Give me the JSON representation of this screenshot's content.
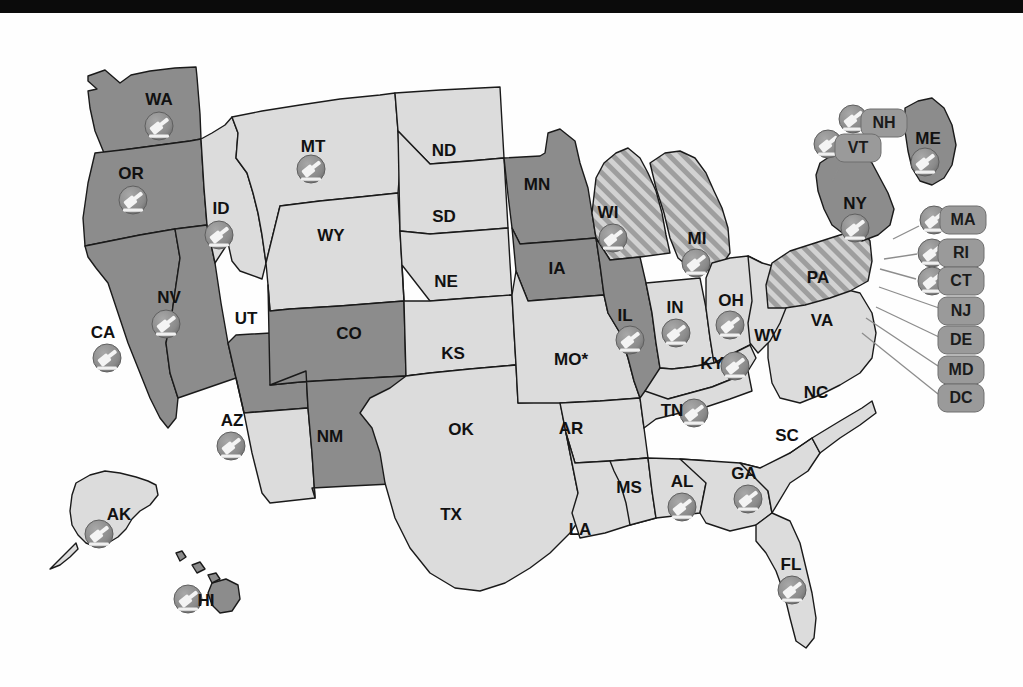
{
  "figure": {
    "kind": "choropleth-map",
    "region": "United States",
    "top_banner_color": "#0b0b0b",
    "background_color": "#ffffff"
  },
  "legend_colors": {
    "dark_gray": "#8c8c8c",
    "light_gray": "#dcdcdc",
    "hatched_base": "#d0d0d0",
    "hatched_stripe": "#9b9b9b",
    "outline": "#1a1a1a",
    "pill_fill": "#9a9a9a",
    "icon_badge": "#8a8a8a",
    "icon_glyph": "#f2f2f2",
    "leader_line": "#8d8d8d"
  },
  "icon": {
    "name": "gavel-icon",
    "description": "white gavel glyph inside a gray circular badge"
  },
  "annotations": {
    "missouri_asterisk": "MO*"
  },
  "states": [
    {
      "code": "WA",
      "label": "WA",
      "fill": "dark",
      "icon": true,
      "lx": 159,
      "ly": 88,
      "ix": 159,
      "iy": 113
    },
    {
      "code": "OR",
      "label": "OR",
      "fill": "dark",
      "icon": true,
      "lx": 131,
      "ly": 162,
      "ix": 133,
      "iy": 187
    },
    {
      "code": "CA",
      "label": "CA",
      "fill": "dark",
      "icon": true,
      "lx": 103,
      "ly": 321,
      "ix": 107,
      "iy": 345
    },
    {
      "code": "NV",
      "label": "NV",
      "fill": "dark",
      "icon": true,
      "lx": 169,
      "ly": 286,
      "ix": 166,
      "iy": 311
    },
    {
      "code": "ID",
      "label": "ID",
      "fill": "light",
      "icon": true,
      "lx": 221,
      "ly": 197,
      "ix": 219,
      "iy": 222
    },
    {
      "code": "MT",
      "label": "MT",
      "fill": "light",
      "icon": true,
      "lx": 313,
      "ly": 135,
      "ix": 311,
      "iy": 156
    },
    {
      "code": "WY",
      "label": "WY",
      "fill": "light",
      "icon": false,
      "lx": 331,
      "ly": 224
    },
    {
      "code": "UT",
      "label": "UT",
      "fill": "dark",
      "icon": false,
      "lx": 246,
      "ly": 307
    },
    {
      "code": "AZ",
      "label": "AZ",
      "fill": "light",
      "icon": true,
      "lx": 232,
      "ly": 409,
      "ix": 231,
      "iy": 433
    },
    {
      "code": "CO",
      "label": "CO",
      "fill": "dark",
      "icon": false,
      "lx": 349,
      "ly": 322
    },
    {
      "code": "NM",
      "label": "NM",
      "fill": "dark",
      "icon": false,
      "lx": 330,
      "ly": 425
    },
    {
      "code": "ND",
      "label": "ND",
      "fill": "light",
      "icon": false,
      "lx": 444,
      "ly": 139
    },
    {
      "code": "SD",
      "label": "SD",
      "fill": "light",
      "icon": false,
      "lx": 444,
      "ly": 205
    },
    {
      "code": "NE",
      "label": "NE",
      "fill": "light",
      "icon": false,
      "lx": 446,
      "ly": 270
    },
    {
      "code": "KS",
      "label": "KS",
      "fill": "light",
      "icon": false,
      "lx": 453,
      "ly": 342
    },
    {
      "code": "OK",
      "label": "OK",
      "fill": "light",
      "icon": false,
      "lx": 461,
      "ly": 418
    },
    {
      "code": "TX",
      "label": "TX",
      "fill": "light",
      "icon": false,
      "lx": 451,
      "ly": 503
    },
    {
      "code": "MN",
      "label": "MN",
      "fill": "dark",
      "icon": false,
      "lx": 537,
      "ly": 173
    },
    {
      "code": "IA",
      "label": "IA",
      "fill": "dark",
      "icon": false,
      "lx": 557,
      "ly": 257
    },
    {
      "code": "MO",
      "label": "MO*",
      "fill": "light",
      "icon": false,
      "lx": 571,
      "ly": 348
    },
    {
      "code": "AR",
      "label": "AR",
      "fill": "light",
      "icon": false,
      "lx": 571,
      "ly": 417
    },
    {
      "code": "LA",
      "label": "LA",
      "fill": "light",
      "icon": false,
      "lx": 580,
      "ly": 518
    },
    {
      "code": "WI",
      "label": "WI",
      "fill": "hatch",
      "icon": true,
      "lx": 608,
      "ly": 201,
      "ix": 613,
      "iy": 225
    },
    {
      "code": "IL",
      "label": "IL",
      "fill": "dark",
      "icon": true,
      "lx": 625,
      "ly": 304,
      "ix": 630,
      "iy": 327
    },
    {
      "code": "MI",
      "label": "MI",
      "fill": "hatch",
      "icon": true,
      "lx": 697,
      "ly": 227,
      "ix": 696,
      "iy": 250
    },
    {
      "code": "IN",
      "label": "IN",
      "fill": "light",
      "icon": true,
      "lx": 675,
      "ly": 296,
      "ix": 676,
      "iy": 320
    },
    {
      "code": "OH",
      "label": "OH",
      "fill": "light",
      "icon": true,
      "lx": 731,
      "ly": 289,
      "ix": 730,
      "iy": 312
    },
    {
      "code": "KY",
      "label": "KY",
      "fill": "light",
      "icon": true,
      "lx": 712,
      "ly": 352,
      "ix": 735,
      "iy": 353
    },
    {
      "code": "TN",
      "label": "TN",
      "fill": "light",
      "icon": true,
      "lx": 672,
      "ly": 399,
      "ix": 694,
      "iy": 400
    },
    {
      "code": "MS",
      "label": "MS",
      "fill": "light",
      "icon": false,
      "lx": 629,
      "ly": 476
    },
    {
      "code": "AL",
      "label": "AL",
      "fill": "light",
      "icon": true,
      "lx": 682,
      "ly": 470,
      "ix": 682,
      "iy": 494
    },
    {
      "code": "GA",
      "label": "GA",
      "fill": "light",
      "icon": true,
      "lx": 744,
      "ly": 462,
      "ix": 748,
      "iy": 486
    },
    {
      "code": "FL",
      "label": "FL",
      "fill": "light",
      "icon": true,
      "lx": 791,
      "ly": 553,
      "ix": 792,
      "iy": 577
    },
    {
      "code": "SC",
      "label": "SC",
      "fill": "light",
      "icon": false,
      "lx": 787,
      "ly": 424
    },
    {
      "code": "NC",
      "label": "NC",
      "fill": "light",
      "icon": false,
      "lx": 816,
      "ly": 381
    },
    {
      "code": "VA",
      "label": "VA",
      "fill": "light",
      "icon": false,
      "lx": 822,
      "ly": 309
    },
    {
      "code": "WV",
      "label": "WV",
      "fill": "light",
      "icon": false,
      "lx": 768,
      "ly": 324
    },
    {
      "code": "PA",
      "label": "PA",
      "fill": "hatch",
      "icon": false,
      "lx": 818,
      "ly": 266
    },
    {
      "code": "NY",
      "label": "NY",
      "fill": "dark",
      "icon": true,
      "lx": 855,
      "ly": 192,
      "ix": 855,
      "iy": 215
    },
    {
      "code": "ME",
      "label": "ME",
      "fill": "dark",
      "icon": true,
      "lx": 928,
      "ly": 127,
      "ix": 925,
      "iy": 149
    },
    {
      "code": "AK",
      "label": "AK",
      "fill": "light",
      "icon": true,
      "lx": 119,
      "ly": 503,
      "ix": 99,
      "iy": 521
    },
    {
      "code": "HI",
      "label": "HI",
      "fill": "dark",
      "icon": true,
      "lx": 206,
      "ly": 589,
      "ix": 188,
      "iy": 586
    }
  ],
  "callouts": [
    {
      "code": "NH",
      "label": "NH",
      "icon": true,
      "px": 884,
      "py": 110,
      "ix": 853,
      "iy": 106,
      "leader": [
        [
          868,
          122
        ],
        [
          855,
          150
        ]
      ]
    },
    {
      "code": "VT",
      "label": "VT",
      "icon": true,
      "px": 858,
      "py": 135,
      "ix": 828,
      "iy": 131,
      "leader": [
        [
          843,
          147
        ],
        [
          832,
          168
        ]
      ]
    },
    {
      "code": "MA",
      "label": "MA",
      "icon": true,
      "px": 963,
      "py": 207,
      "ix": 934,
      "iy": 207,
      "leader": [
        [
          919,
          213
        ],
        [
          893,
          226
        ]
      ]
    },
    {
      "code": "RI",
      "label": "RI",
      "icon": true,
      "px": 961,
      "py": 240,
      "ix": 932,
      "iy": 240,
      "leader": [
        [
          917,
          241
        ],
        [
          884,
          246
        ]
      ]
    },
    {
      "code": "CT",
      "label": "CT",
      "icon": true,
      "px": 961,
      "py": 268,
      "ix": 932,
      "iy": 268,
      "leader": [
        [
          916,
          266
        ],
        [
          880,
          256
        ]
      ]
    },
    {
      "code": "NJ",
      "label": "NJ",
      "icon": false,
      "px": 961,
      "py": 298,
      "leader": [
        [
          939,
          295
        ],
        [
          879,
          274
        ]
      ]
    },
    {
      "code": "DE",
      "label": "DE",
      "icon": false,
      "px": 961,
      "py": 327,
      "leader": [
        [
          939,
          324
        ],
        [
          876,
          294
        ]
      ]
    },
    {
      "code": "MD",
      "label": "MD",
      "icon": false,
      "px": 961,
      "py": 357,
      "leader": [
        [
          938,
          353
        ],
        [
          866,
          305
        ]
      ]
    },
    {
      "code": "DC",
      "label": "DC",
      "icon": false,
      "px": 961,
      "py": 385,
      "leader": [
        [
          938,
          381
        ],
        [
          862,
          320
        ]
      ]
    }
  ]
}
